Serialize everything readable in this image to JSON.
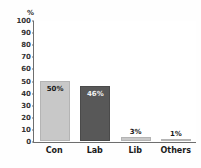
{
  "chart_data": {
    "type": "bar",
    "title": "",
    "xlabel": "",
    "ylabel": "%",
    "unit_label": "%",
    "categories": [
      "Con",
      "Lab",
      "Lib",
      "Others"
    ],
    "values": [
      50,
      46,
      3,
      1
    ],
    "data_labels": [
      "50%",
      "46%",
      "3%",
      "1%"
    ],
    "bar_colors": [
      "#c8c8c8",
      "#585858",
      "#c8c8c8",
      "#c8c8c8"
    ],
    "ylim": [
      0,
      100
    ],
    "yticks": [
      100,
      90,
      80,
      70,
      60,
      50,
      40,
      30,
      20,
      10,
      0
    ],
    "ytick_labels": [
      "100",
      "90",
      "80",
      "70",
      "60",
      "50",
      "40",
      "30",
      "20",
      "10",
      "0"
    ],
    "grid": false,
    "legend": "none",
    "axis_color": "#6e6e6e",
    "background": "#ffffff"
  },
  "series": [
    {
      "category": "Con",
      "value": 50,
      "label": "50%",
      "color": "#c8c8c8",
      "label_position": "inside"
    },
    {
      "category": "Lab",
      "value": 46,
      "label": "46%",
      "color": "#585858",
      "label_position": "inside"
    },
    {
      "category": "Lib",
      "value": 3,
      "label": "3%",
      "color": "#c8c8c8",
      "label_position": "above"
    },
    {
      "category": "Others",
      "value": 1,
      "label": "1%",
      "color": "#c8c8c8",
      "label_position": "above"
    }
  ]
}
